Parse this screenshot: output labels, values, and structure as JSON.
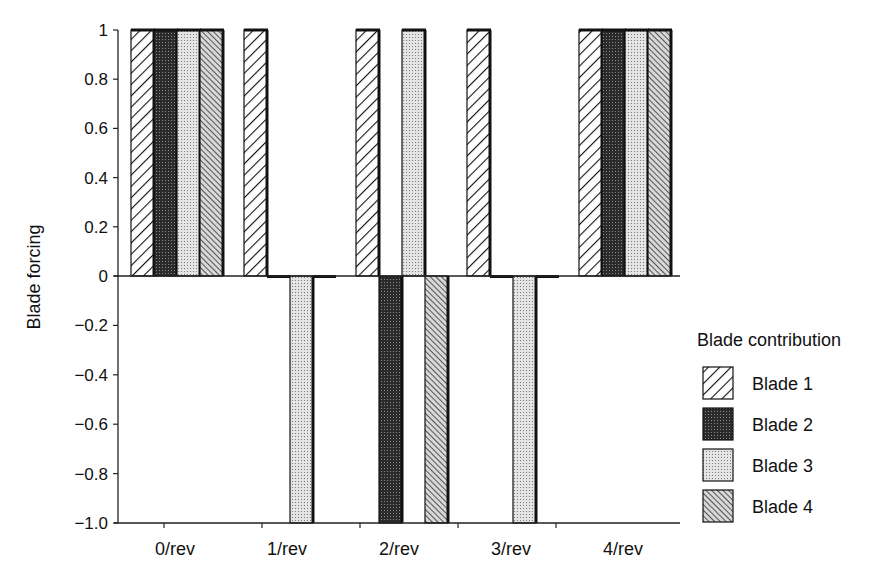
{
  "chart_data": {
    "type": "bar",
    "title": "",
    "xlabel": "",
    "ylabel": "Blade forcing",
    "ylim": [
      -1.0,
      1.0
    ],
    "yticks": [
      1,
      0.8,
      0.6,
      0.4,
      0.2,
      0,
      -0.2,
      -0.4,
      -0.6,
      -0.8,
      -1.0
    ],
    "ytick_labels": [
      "1",
      "0.8",
      "0.6",
      "0.4",
      "0.2",
      "0",
      "−0.2",
      "−0.4",
      "−0.6",
      "−0.8",
      "−1.0"
    ],
    "categories": [
      "0/rev",
      "1/rev",
      "2/rev",
      "3/rev",
      "4/rev"
    ],
    "series": [
      {
        "name": "Blade 1",
        "pattern": "diagonal-hatch-light",
        "values": [
          1,
          1,
          1,
          1,
          1
        ]
      },
      {
        "name": "Blade 2",
        "pattern": "dark-dots",
        "values": [
          1,
          0,
          -1,
          0,
          1
        ]
      },
      {
        "name": "Blade 3",
        "pattern": "light-dots",
        "values": [
          1,
          -1,
          1,
          -1,
          1
        ]
      },
      {
        "name": "Blade 4",
        "pattern": "dense-diagonal-hatch",
        "values": [
          1,
          0,
          -1,
          0,
          1
        ]
      }
    ],
    "legend": {
      "title": "Blade contribution",
      "position": "right"
    },
    "grid": false
  }
}
